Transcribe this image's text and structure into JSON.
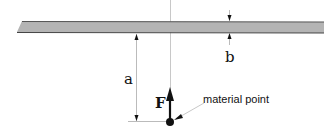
{
  "diagram": {
    "labels": {
      "distance": "a",
      "thickness": "b",
      "force": "F",
      "point": "material point"
    },
    "colors": {
      "beam_fill": "#b4b4b4",
      "beam_edge": "#444444",
      "line": "#111111",
      "guide": "#bbbbbb"
    }
  }
}
